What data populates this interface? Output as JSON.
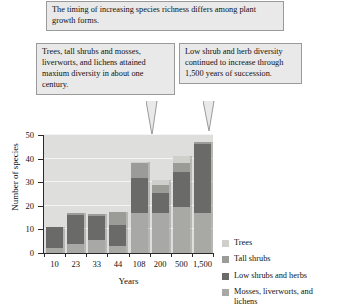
{
  "callouts": [
    {
      "id": "top",
      "text": "The timing of increasing species richness differs among plant growth forms.",
      "has_tail": false
    },
    {
      "id": "left",
      "text": "Trees, tall shrubs and mosses, liverworts, and lichens attained maxium diversity in about one century.",
      "has_tail": true
    },
    {
      "id": "right",
      "text": "Low shrub and herb diversity continued to increase through 1,500 years of succession.",
      "has_tail": true
    }
  ],
  "chart_data": {
    "type": "bar",
    "subtype": "stacked",
    "title": "",
    "xlabel": "Years",
    "ylabel": "Number of species",
    "categories": [
      "10",
      "23",
      "33",
      "44",
      "108",
      "200",
      "500",
      "1,500"
    ],
    "ylim": [
      0,
      50
    ],
    "yticks": [
      0,
      10,
      20,
      30,
      40,
      50
    ],
    "grid": true,
    "legend_position": "right",
    "series": [
      {
        "name": "Mosses, liverworts, and lichens",
        "color": "#a8a8a4",
        "values": [
          2,
          4,
          5.5,
          3,
          17,
          17,
          19.5,
          17
        ]
      },
      {
        "name": "Low shrubs and herbs",
        "color": "#6a6a68",
        "values": [
          9,
          12,
          10,
          9,
          15,
          8.5,
          15,
          29
        ]
      },
      {
        "name": "Tall shrubs",
        "color": "#9b9b97",
        "values": [
          0,
          1,
          1,
          5.5,
          6,
          3.5,
          3.5,
          1
        ]
      },
      {
        "name": "Trees",
        "color": "#cfcfcb",
        "values": [
          0,
          0,
          0,
          0,
          0.5,
          2,
          3,
          0
        ]
      }
    ],
    "totals": [
      11,
      17,
      16.5,
      17.5,
      38.5,
      31,
      41,
      47
    ],
    "legend_entries": [
      "Trees",
      "Tall shrubs",
      "Low shrubs and herbs",
      "Mosses, liverworts, and lichens"
    ],
    "colors": {
      "plot_background": "#dededc",
      "gridline": "#f4f4f2",
      "axis": "#2a2a2a",
      "trees": "#cfcfcb",
      "tall_shrubs": "#9b9b97",
      "low_shrubs_and_herbs": "#6a6a68",
      "mosses_liverworts_and_lichens": "#a8a8a4"
    }
  }
}
